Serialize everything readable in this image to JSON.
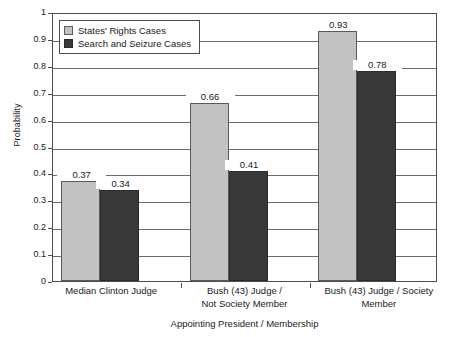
{
  "chart_data": {
    "type": "bar",
    "title": "",
    "subtitle": "",
    "xlabel": "Appointing President / Membership",
    "ylabel": "Probability",
    "categories": [
      "Median Clinton Judge",
      "Bush (43) Judge /\nNot Society Member",
      "Bush (43) Judge / Society\nMember"
    ],
    "series": [
      {
        "name": "States' Rights Cases",
        "color": "#c2c2c2",
        "values": [
          0.37,
          0.66,
          0.93
        ],
        "labels": [
          "0.37",
          "0.66",
          "0.93"
        ]
      },
      {
        "name": "Search and Seizure Cases",
        "color": "#383838",
        "values": [
          0.34,
          0.41,
          0.78
        ],
        "labels": [
          "0.34",
          "0.41",
          "0.78"
        ]
      }
    ],
    "ylim": [
      0,
      1
    ],
    "ytick_step": 0.1,
    "ytick_labels": [
      "1",
      "0.9",
      "0.8",
      "0.7",
      "0.6",
      "0.5",
      "0.4",
      "0.3",
      "0.2",
      "0.1",
      "0"
    ],
    "grid": true,
    "grid_axis": "y",
    "legend_position": "top-left",
    "data_labels": true
  }
}
